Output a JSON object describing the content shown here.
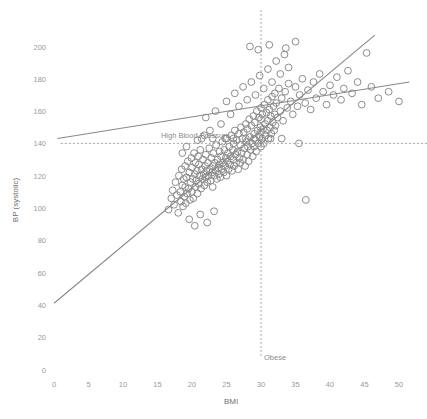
{
  "chart_data": {
    "type": "scatter",
    "title": "",
    "xlabel": "BMI",
    "ylabel": "BP (systolic)",
    "xlim": [
      0,
      52
    ],
    "ylim": [
      0,
      212
    ],
    "xticks": [
      0,
      5,
      10,
      15,
      20,
      25,
      30,
      35,
      40,
      45,
      50
    ],
    "xtick_labels": [
      "0",
      "5",
      "10",
      "15",
      "20",
      "25",
      "30",
      "35",
      "40",
      "45",
      "50"
    ],
    "yticks": [
      0,
      20,
      40,
      60,
      80,
      100,
      120,
      140,
      160,
      180,
      200
    ],
    "ytick_labels": [
      "0",
      "20",
      "40",
      "60",
      "80",
      "100",
      "120",
      "140",
      "160",
      "180",
      "200"
    ],
    "grid": false,
    "legend": "none",
    "marker": "open-circle",
    "marker_radius": 3.4,
    "marker_color": "#8c8c8c",
    "annotations": [
      {
        "name": "high-blood-pressure",
        "text": "High Blood Pressure",
        "type": "hline",
        "y": 140,
        "x_text": 15.5,
        "style": "dashed",
        "color": "#9e9e9e"
      },
      {
        "name": "obese",
        "text": "Obese",
        "type": "vline",
        "x": 30,
        "y_text": 6,
        "style": "dashed",
        "color": "#9e9e9e"
      }
    ],
    "series": [
      {
        "name": "steep-fit-line",
        "type": "line",
        "color": "#888888",
        "x": [
          0,
          46.5
        ],
        "y": [
          41,
          207
        ]
      },
      {
        "name": "shallow-fit-line",
        "type": "line",
        "color": "#888888",
        "x": [
          0.5,
          51.5
        ],
        "y": [
          143,
          178
        ]
      },
      {
        "name": "patients",
        "type": "scatter",
        "color": "#8c8c8c",
        "points": [
          [
            16.6,
            99
          ],
          [
            17.0,
            106
          ],
          [
            17.2,
            111
          ],
          [
            17.4,
            102
          ],
          [
            17.6,
            116
          ],
          [
            17.8,
            108
          ],
          [
            18.0,
            97
          ],
          [
            18.1,
            120
          ],
          [
            18.3,
            110
          ],
          [
            18.4,
            104
          ],
          [
            18.5,
            124
          ],
          [
            18.6,
            114
          ],
          [
            18.7,
            101
          ],
          [
            18.8,
            118
          ],
          [
            18.9,
            107
          ],
          [
            19.0,
            113
          ],
          [
            19.0,
            126
          ],
          [
            19.1,
            103
          ],
          [
            19.2,
            119
          ],
          [
            19.3,
            109
          ],
          [
            19.4,
            129
          ],
          [
            19.5,
            112
          ],
          [
            19.6,
            122
          ],
          [
            19.7,
            105
          ],
          [
            19.8,
            116
          ],
          [
            19.9,
            131
          ],
          [
            20.0,
            110
          ],
          [
            20.0,
            125
          ],
          [
            20.1,
            118
          ],
          [
            20.2,
            106
          ],
          [
            20.3,
            134
          ],
          [
            20.4,
            121
          ],
          [
            20.5,
            113
          ],
          [
            20.5,
            128
          ],
          [
            20.6,
            117
          ],
          [
            20.7,
            123
          ],
          [
            20.8,
            109
          ],
          [
            20.9,
            132
          ],
          [
            21.0,
            115
          ],
          [
            21.0,
            127
          ],
          [
            21.1,
            120
          ],
          [
            21.2,
            136
          ],
          [
            21.3,
            112
          ],
          [
            21.4,
            124
          ],
          [
            21.5,
            118
          ],
          [
            21.6,
            130
          ],
          [
            21.7,
            121
          ],
          [
            21.8,
            114
          ],
          [
            21.9,
            126
          ],
          [
            22.0,
            119
          ],
          [
            22.0,
            133
          ],
          [
            22.1,
            123
          ],
          [
            22.2,
            116
          ],
          [
            22.3,
            128
          ],
          [
            22.4,
            120
          ],
          [
            22.5,
            137
          ],
          [
            22.6,
            124
          ],
          [
            22.7,
            117
          ],
          [
            22.8,
            131
          ],
          [
            22.9,
            122
          ],
          [
            23.0,
            126
          ],
          [
            23.0,
            113
          ],
          [
            23.1,
            134
          ],
          [
            23.2,
            120
          ],
          [
            23.3,
            128
          ],
          [
            23.4,
            123
          ],
          [
            23.5,
            139
          ],
          [
            23.6,
            118
          ],
          [
            23.7,
            130
          ],
          [
            23.8,
            125
          ],
          [
            23.9,
            121
          ],
          [
            24.0,
            135
          ],
          [
            24.0,
            127
          ],
          [
            24.1,
            119
          ],
          [
            24.2,
            132
          ],
          [
            24.3,
            124
          ],
          [
            24.4,
            141
          ],
          [
            24.5,
            128
          ],
          [
            24.6,
            122
          ],
          [
            24.7,
            136
          ],
          [
            24.8,
            126
          ],
          [
            24.9,
            131
          ],
          [
            25.0,
            120
          ],
          [
            25.0,
            143
          ],
          [
            25.1,
            129
          ],
          [
            25.2,
            134
          ],
          [
            25.3,
            124
          ],
          [
            25.4,
            138
          ],
          [
            25.5,
            127
          ],
          [
            25.6,
            132
          ],
          [
            25.7,
            145
          ],
          [
            25.8,
            123
          ],
          [
            25.9,
            136
          ],
          [
            26.0,
            130
          ],
          [
            26.0,
            140
          ],
          [
            26.1,
            126
          ],
          [
            26.2,
            148
          ],
          [
            26.3,
            133
          ],
          [
            26.4,
            128
          ],
          [
            26.5,
            142
          ],
          [
            26.6,
            135
          ],
          [
            26.7,
            124
          ],
          [
            26.8,
            146
          ],
          [
            26.9,
            131
          ],
          [
            27.0,
            139
          ],
          [
            27.0,
            128
          ],
          [
            27.1,
            150
          ],
          [
            27.2,
            134
          ],
          [
            27.3,
            143
          ],
          [
            27.4,
            130
          ],
          [
            27.5,
            147
          ],
          [
            27.6,
            137
          ],
          [
            27.7,
            126
          ],
          [
            27.8,
            152
          ],
          [
            27.9,
            141
          ],
          [
            28.0,
            133
          ],
          [
            28.0,
            149
          ],
          [
            28.1,
            138
          ],
          [
            28.2,
            129
          ],
          [
            28.3,
            155
          ],
          [
            28.4,
            144
          ],
          [
            28.5,
            136
          ],
          [
            28.6,
            151
          ],
          [
            28.7,
            140
          ],
          [
            28.8,
            132
          ],
          [
            28.9,
            157
          ],
          [
            29.0,
            146
          ],
          [
            29.0,
            138
          ],
          [
            29.1,
            153
          ],
          [
            29.2,
            142
          ],
          [
            29.3,
            135
          ],
          [
            29.4,
            160
          ],
          [
            29.5,
            148
          ],
          [
            29.6,
            140
          ],
          [
            29.7,
            156
          ],
          [
            29.8,
            144
          ],
          [
            29.9,
            150
          ],
          [
            30.0,
            138
          ],
          [
            30.0,
            162
          ],
          [
            30.0,
            147
          ],
          [
            30.0,
            155
          ],
          [
            30.1,
            142
          ],
          [
            30.2,
            158
          ],
          [
            30.3,
            149
          ],
          [
            30.4,
            140
          ],
          [
            30.5,
            164
          ],
          [
            30.6,
            152
          ],
          [
            30.7,
            145
          ],
          [
            30.8,
            159
          ],
          [
            30.9,
            148
          ],
          [
            31.0,
            167
          ],
          [
            31.0,
            154
          ],
          [
            31.1,
            143
          ],
          [
            31.2,
            161
          ],
          [
            31.3,
            150
          ],
          [
            31.4,
            157
          ],
          [
            31.5,
            146
          ],
          [
            31.6,
            169
          ],
          [
            31.7,
            153
          ],
          [
            31.8,
            163
          ],
          [
            31.9,
            148
          ],
          [
            32.0,
            158
          ],
          [
            32.0,
            171
          ],
          [
            32.1,
            151
          ],
          [
            32.2,
            165
          ],
          [
            32.4,
            156
          ],
          [
            32.6,
            174
          ],
          [
            32.8,
            160
          ],
          [
            33.0,
            168
          ],
          [
            33.2,
            154
          ],
          [
            33.5,
            172
          ],
          [
            33.8,
            162
          ],
          [
            34.0,
            177
          ],
          [
            34.3,
            166
          ],
          [
            34.6,
            158
          ],
          [
            35.0,
            175
          ],
          [
            35.3,
            163
          ],
          [
            35.6,
            170
          ],
          [
            36.0,
            180
          ],
          [
            36.4,
            165
          ],
          [
            36.5,
            105
          ],
          [
            36.8,
            173
          ],
          [
            37.2,
            161
          ],
          [
            37.6,
            178
          ],
          [
            38.0,
            168
          ],
          [
            38.5,
            183
          ],
          [
            39.0,
            172
          ],
          [
            39.5,
            164
          ],
          [
            40.0,
            176
          ],
          [
            40.5,
            170
          ],
          [
            41.0,
            181
          ],
          [
            41.6,
            167
          ],
          [
            42.0,
            174
          ],
          [
            42.6,
            185
          ],
          [
            43.2,
            171
          ],
          [
            44.0,
            178
          ],
          [
            44.6,
            164
          ],
          [
            45.3,
            196
          ],
          [
            46.0,
            175
          ],
          [
            47.0,
            168
          ],
          [
            48.5,
            172
          ],
          [
            50.0,
            166
          ],
          [
            22.0,
            156
          ],
          [
            22.6,
            148
          ],
          [
            23.4,
            160
          ],
          [
            24.2,
            152
          ],
          [
            25.0,
            166
          ],
          [
            25.6,
            158
          ],
          [
            26.2,
            171
          ],
          [
            26.8,
            163
          ],
          [
            27.4,
            175
          ],
          [
            28.0,
            167
          ],
          [
            28.6,
            178
          ],
          [
            29.2,
            170
          ],
          [
            29.8,
            182
          ],
          [
            30.4,
            174
          ],
          [
            31.0,
            186
          ],
          [
            31.6,
            178
          ],
          [
            32.2,
            191
          ],
          [
            32.8,
            183
          ],
          [
            33.4,
            195
          ],
          [
            34.0,
            187
          ],
          [
            28.4,
            200
          ],
          [
            29.6,
            198
          ],
          [
            31.2,
            201
          ],
          [
            33.6,
            199
          ],
          [
            35.0,
            203
          ],
          [
            24.8,
            143
          ],
          [
            26.0,
            143
          ],
          [
            21.4,
            143
          ],
          [
            23.0,
            143
          ],
          [
            27.8,
            143
          ],
          [
            29.0,
            143
          ],
          [
            30.2,
            143
          ],
          [
            31.4,
            143
          ],
          [
            33.0,
            143
          ],
          [
            35.5,
            140
          ],
          [
            19.6,
            93
          ],
          [
            20.4,
            89
          ],
          [
            21.2,
            96
          ],
          [
            22.2,
            91
          ],
          [
            23.2,
            98
          ],
          [
            20.8,
            142
          ],
          [
            19.2,
            138
          ],
          [
            21.8,
            145
          ],
          [
            18.6,
            134
          ]
        ]
      }
    ]
  },
  "axis": {
    "x_title": "BMI",
    "y_title": "BP (systolic)"
  }
}
